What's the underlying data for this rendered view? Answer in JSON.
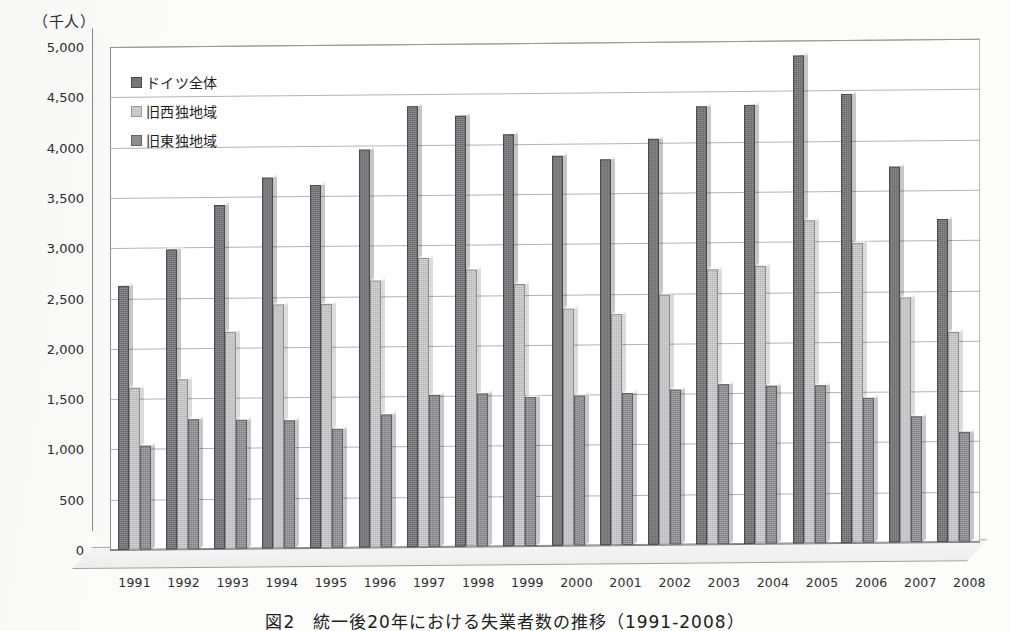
{
  "unit_label": "（千人）",
  "caption": "図2　統一後20年における失業者数の推移（1991-2008）",
  "legend": {
    "items": [
      {
        "label": "ドイツ全体",
        "color": "#76767a"
      },
      {
        "label": "旧西独地域",
        "color": "#c9c9c9"
      },
      {
        "label": "旧東独地域",
        "color": "#8e8e92"
      }
    ]
  },
  "chart_data": {
    "type": "bar",
    "title": "図2　統一後20年における失業者数の推移（1991-2008）",
    "xlabel": "",
    "ylabel": "（千人）",
    "ylim": [
      0,
      5000
    ],
    "ytick_labels": [
      "5,000",
      "4,500",
      "4,000",
      "3,500",
      "3,000",
      "2,500",
      "2,000",
      "1,500",
      "1,000",
      "500",
      "0"
    ],
    "ytick_values": [
      5000,
      4500,
      4000,
      3500,
      3000,
      2500,
      2000,
      1500,
      1000,
      500,
      0
    ],
    "grid": true,
    "legend_position": "upper-left-inside",
    "categories": [
      "1991",
      "1992",
      "1993",
      "1994",
      "1995",
      "1996",
      "1997",
      "1998",
      "1999",
      "2000",
      "2001",
      "2002",
      "2003",
      "2004",
      "2005",
      "2006",
      "2007",
      "2008"
    ],
    "series": [
      {
        "name": "ドイツ全体",
        "color": "#76767a",
        "values": [
          2620,
          2980,
          3420,
          3690,
          3610,
          3960,
          4380,
          4280,
          4100,
          3880,
          3840,
          4040,
          4350,
          4360,
          4850,
          4460,
          3740,
          3210
        ]
      },
      {
        "name": "旧西独地域",
        "color": "#c9c9c9",
        "values": [
          1610,
          1690,
          2160,
          2430,
          2430,
          2650,
          2870,
          2750,
          2600,
          2360,
          2300,
          2490,
          2730,
          2760,
          3210,
          2980,
          2440,
          2090
        ]
      },
      {
        "name": "旧東独地域",
        "color": "#8e8e92",
        "values": [
          1030,
          1290,
          1280,
          1270,
          1180,
          1320,
          1510,
          1520,
          1480,
          1490,
          1510,
          1540,
          1590,
          1570,
          1570,
          1440,
          1250,
          1090
        ]
      }
    ]
  }
}
